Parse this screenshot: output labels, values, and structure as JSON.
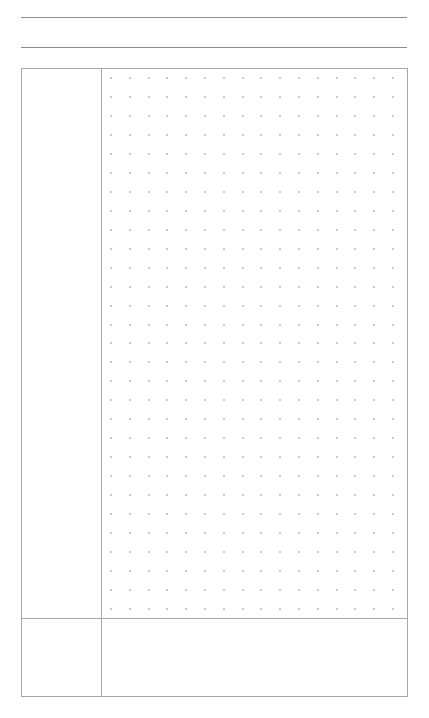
{
  "page": {
    "type": "dot-grid-note-template",
    "background_color": "#ffffff"
  },
  "header": {
    "lines": [
      {
        "name": "title-line",
        "y": 17,
        "color": "#8c8c8c"
      },
      {
        "name": "subtitle-line",
        "y": 47,
        "color": "#8c8c8c"
      }
    ]
  },
  "layout": {
    "box": {
      "x": 21,
      "y": 68,
      "width": 387,
      "height": 629,
      "border_color": "#a8a8a8"
    },
    "cue_column_divider_x": 101,
    "summary_divider_y": 618
  },
  "dot_grid": {
    "columns": 16,
    "rows": 29,
    "start_x": 111,
    "start_y": 78,
    "spacing_x": 18.8,
    "spacing_y": 18.96,
    "dot_color": "#b8b8b8"
  },
  "sections": {
    "cue_column": {
      "label": ""
    },
    "notes_area": {
      "label": ""
    },
    "summary_left": {
      "label": ""
    },
    "summary_area": {
      "label": ""
    }
  }
}
